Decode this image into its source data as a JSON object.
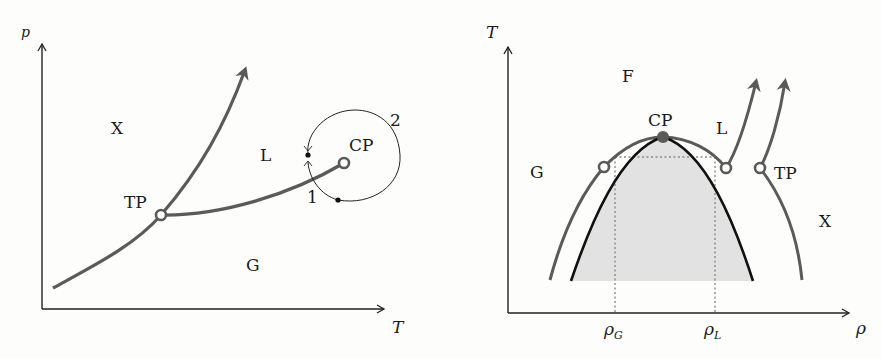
{
  "left_diagram": {
    "title": "p-T phase diagram",
    "axes": {
      "y_label": "p",
      "x_label": "T"
    },
    "regions": {
      "solid": "X",
      "liquid": "L",
      "gas": "G"
    },
    "points": {
      "triple_point": "TP",
      "critical_point": "CP"
    },
    "path_labels": {
      "start": "1",
      "end": "2"
    },
    "colors": {
      "curve": "#5a5a5a",
      "axis": "#222222"
    }
  },
  "right_diagram": {
    "title": "T-rho phase diagram",
    "axes": {
      "y_label": "T",
      "x_label": "ρ"
    },
    "regions": {
      "fluid": "F",
      "gas": "G",
      "liquid": "L",
      "solid": "X"
    },
    "points": {
      "critical_point": "CP",
      "triple_point": "TP"
    },
    "ticks": {
      "rho_gas": "ρ",
      "rho_gas_sub": "G",
      "rho_liquid": "ρ",
      "rho_liquid_sub": "L"
    },
    "colors": {
      "coexistence_fill": "#e2e2e2",
      "outer_curve": "#5a5a5a",
      "inner_curve": "#111111",
      "critical_point": "#5a5a5a"
    }
  }
}
